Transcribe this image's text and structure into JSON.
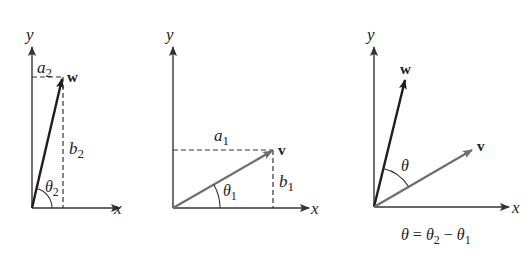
{
  "figure": {
    "panels": [
      {
        "id": "panel-w",
        "axis_labels": {
          "x": "x",
          "y": "y"
        },
        "vector": {
          "name": "w",
          "components": [
            "a",
            "b"
          ],
          "component_subscript": "2"
        },
        "angle": {
          "symbol": "θ",
          "subscript": "2"
        }
      },
      {
        "id": "panel-v",
        "axis_labels": {
          "x": "x",
          "y": "y"
        },
        "vector": {
          "name": "v",
          "components": [
            "a",
            "b"
          ],
          "component_subscript": "1"
        },
        "angle": {
          "symbol": "θ",
          "subscript": "1"
        }
      },
      {
        "id": "panel-angle-between",
        "axis_labels": {
          "x": "x",
          "y": "y"
        },
        "vectors": [
          "w",
          "v"
        ],
        "angle": {
          "symbol": "θ"
        },
        "caption": {
          "lhs": "θ",
          "eq": "=",
          "t2": "θ",
          "s2": "2",
          "minus": "−",
          "t1": "θ",
          "s1": "1"
        }
      }
    ]
  },
  "colors": {
    "ink": "#222222",
    "vector_v": "#6e6e6e",
    "vector_w": "#1e1e1e"
  }
}
